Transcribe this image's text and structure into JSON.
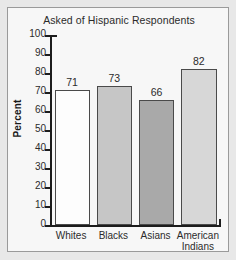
{
  "chart_data": {
    "type": "bar",
    "title": "Asked of Hispanic Respondents",
    "xlabel": "",
    "ylabel": "Percent",
    "categories": [
      "Whites",
      "Blacks",
      "Asians",
      "American Indians"
    ],
    "category_lines": [
      [
        "Whites"
      ],
      [
        "Blacks"
      ],
      [
        "Asians"
      ],
      [
        "American",
        "Indians"
      ]
    ],
    "values": [
      71,
      73,
      66,
      82
    ],
    "value_labels": [
      "71",
      "73",
      "66",
      "82"
    ],
    "ylim": [
      0,
      100
    ],
    "ytick_step": 10,
    "yticks": [
      100,
      90,
      80,
      70,
      60,
      50,
      40,
      30,
      20,
      10,
      0
    ],
    "ytick_labels": [
      "100",
      "90",
      "80",
      "70",
      "60",
      "50",
      "40",
      "30",
      "20",
      "10",
      "0"
    ],
    "grid": false,
    "legend": false,
    "legend_position": "none",
    "bar_colors": [
      "#fdfdfd",
      "#c6c6c6",
      "#a9a9a9",
      "#d7d7d7"
    ],
    "bar_edge_color": "#4a4a4a",
    "axis_color": "#1c1c1c",
    "text_color": "#2b2b2b",
    "panel_background": "#f7f7f7",
    "figure_background": "#e8e8e8",
    "panel_border_color": "#9a9a9a"
  }
}
